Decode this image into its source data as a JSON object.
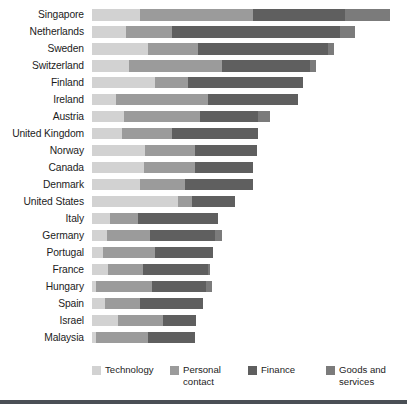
{
  "chart_data": {
    "type": "bar",
    "subtype": "horizontal-stacked",
    "title": "",
    "subtitle": "",
    "xlabel": "",
    "ylabel": "",
    "xlim": [
      0,
      100
    ],
    "grid": false,
    "legend_position": "bottom",
    "categories": [
      "Singapore",
      "Netherlands",
      "Sweden",
      "Switzerland",
      "Finland",
      "Ireland",
      "Austria",
      "United Kingdom",
      "Norway",
      "Canada",
      "Denmark",
      "United States",
      "Italy",
      "Germany",
      "Portugal",
      "France",
      "Hungary",
      "Spain",
      "Israel",
      "Malaysia"
    ],
    "series": [
      {
        "name": "Technology",
        "color": "#d2d2d2",
        "values": [
          16.0,
          11.3,
          18.7,
          12.3,
          21.0,
          8.0,
          10.7,
          10.0,
          17.7,
          17.3,
          16.0,
          28.7,
          6.0,
          5.0,
          3.7,
          5.3,
          1.3,
          4.3,
          8.7,
          1.3
        ]
      },
      {
        "name": "Personal contact",
        "color": "#9b9b9b",
        "values": [
          37.7,
          15.3,
          16.7,
          31.0,
          11.0,
          30.7,
          25.3,
          16.7,
          16.7,
          17.0,
          15.0,
          4.7,
          9.3,
          14.3,
          17.3,
          11.7,
          18.7,
          11.7,
          15.0,
          17.3
        ]
      },
      {
        "name": "Finance",
        "color": "#5f5f5f",
        "values": [
          30.7,
          56.0,
          43.3,
          29.3,
          38.3,
          30.0,
          19.3,
          28.7,
          20.7,
          19.3,
          22.7,
          14.3,
          26.7,
          21.7,
          19.3,
          21.7,
          18.0,
          21.0,
          11.0,
          15.7
        ]
      },
      {
        "name": "Goods and services",
        "color": "#7b7b7b",
        "values": [
          15.0,
          5.0,
          2.0,
          2.0,
          0.0,
          0.0,
          4.0,
          0.0,
          0.0,
          0.0,
          0.0,
          0.0,
          0.0,
          2.3,
          0.0,
          0.7,
          2.0,
          0.0,
          0.0,
          0.0
        ]
      }
    ],
    "totals": [
      99.4,
      87.6,
      80.7,
      74.6,
      70.3,
      68.7,
      59.3,
      55.4,
      55.1,
      53.6,
      53.7,
      47.7,
      42.0,
      43.3,
      40.3,
      39.4,
      40.0,
      37.0,
      34.7,
      34.3
    ]
  },
  "legend": {
    "items": [
      {
        "label": "Technology"
      },
      {
        "label": "Personal contact"
      },
      {
        "label": "Finance"
      },
      {
        "label": "Goods and services"
      }
    ]
  }
}
